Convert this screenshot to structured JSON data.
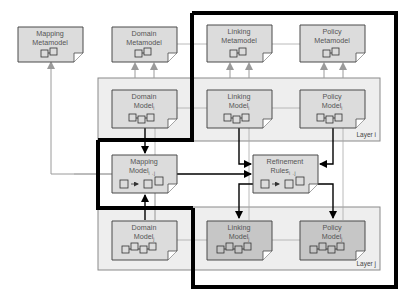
{
  "diagram": {
    "colors": {
      "node_fill": "#dcdcdc",
      "node_fill_dark": "#c6c6c6",
      "layer_fill": "#eeeeee",
      "node_stroke": "#4a4a4a",
      "gray_line": "#9a9a9a",
      "black_line": "#000000"
    },
    "metamodels": {
      "mapping": {
        "line1": "Mapping",
        "line2": "Metamodel"
      },
      "domain": {
        "line1": "Domain",
        "line2": "Metamodel"
      },
      "linking": {
        "line1": "Linking",
        "line2": "Metamodel"
      },
      "policy": {
        "line1": "Policy",
        "line2": "Metamodel"
      }
    },
    "layer_i": {
      "label": "Layer i",
      "domain": {
        "line1": "Domain",
        "line2": "Model",
        "sub": "i"
      },
      "linking": {
        "line1": "Linking",
        "line2": "Model",
        "sub": "i"
      },
      "policy": {
        "line1": "Policy",
        "line2": "Model",
        "sub": "i"
      }
    },
    "mapping_model": {
      "line1": "Mapping",
      "line2": "Model",
      "sub": "i→j"
    },
    "refinement_rules": {
      "line1": "Refinement",
      "line2": "Rules",
      "sub": "i→j"
    },
    "layer_j": {
      "label": "Layer j",
      "domain": {
        "line1": "Domain",
        "line2": "Model",
        "sub": "j"
      },
      "linking": {
        "line1": "Linking",
        "line2": "Model",
        "sub": "j"
      },
      "policy": {
        "line1": "Policy",
        "line2": "Model",
        "sub": "j"
      }
    }
  }
}
